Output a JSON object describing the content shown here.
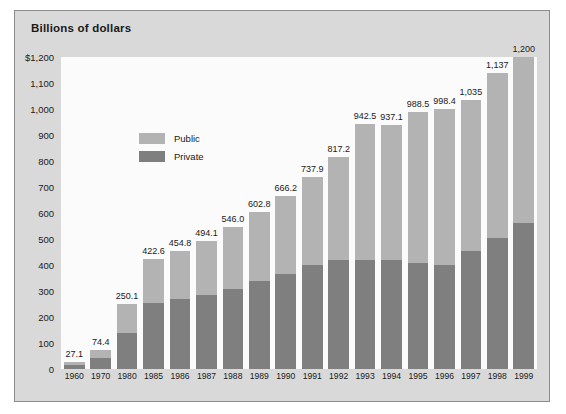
{
  "figure": {
    "title": "Billions of dollars"
  },
  "legend": {
    "position": "top-left",
    "items": [
      {
        "label": "Public",
        "color": "#b3b3b3",
        "name": "legend-public"
      },
      {
        "label": "Private",
        "color": "#7f7f7f",
        "name": "legend-private"
      }
    ]
  },
  "chart_data": {
    "type": "bar",
    "subtype": "stacked",
    "title": "Billions of dollars",
    "xlabel": "",
    "ylabel": "Billions of dollars",
    "ylim": [
      0,
      1200
    ],
    "ytick_labels": [
      "$1,200",
      "1,100",
      "1,000",
      "900",
      "800",
      "700",
      "600",
      "500",
      "400",
      "300",
      "200",
      "100",
      "0"
    ],
    "ytick_values": [
      1200,
      1100,
      1000,
      900,
      800,
      700,
      600,
      500,
      400,
      300,
      200,
      100,
      0
    ],
    "grid": false,
    "categories": [
      "1960",
      "1970",
      "1980",
      "1985",
      "1986",
      "1987",
      "1988",
      "1989",
      "1990",
      "1991",
      "1992",
      "1993",
      "1994",
      "1995",
      "1996",
      "1997",
      "1998",
      "1999"
    ],
    "totals": [
      27.1,
      74.4,
      250.1,
      422.6,
      454.8,
      494.1,
      546.0,
      602.8,
      666.2,
      737.9,
      817.2,
      942.5,
      937.1,
      988.5,
      998.4,
      1035,
      1137,
      1200
    ],
    "total_labels": [
      "27.1",
      "74.4",
      "250.1",
      "422.6",
      "454.8",
      "494.1",
      "546.0",
      "602.8",
      "666.2",
      "737.9",
      "817.2",
      "942.5",
      "937.1",
      "988.5",
      "998.4",
      "1,035",
      "1,137",
      "1,200"
    ],
    "series": [
      {
        "name": "Private",
        "color": "#7f7f7f",
        "values": [
          14,
          42,
          140,
          255,
          268,
          283,
          308,
          338,
          365,
          400,
          418,
          420,
          418,
          408,
          400,
          455,
          505,
          560
        ]
      },
      {
        "name": "Public",
        "color": "#b3b3b3",
        "values": [
          13.1,
          32.4,
          110.1,
          167.6,
          186.8,
          211.1,
          238.0,
          264.8,
          301.2,
          337.9,
          399.2,
          522.5,
          519.1,
          580.5,
          598.4,
          580,
          632,
          640
        ]
      }
    ]
  }
}
